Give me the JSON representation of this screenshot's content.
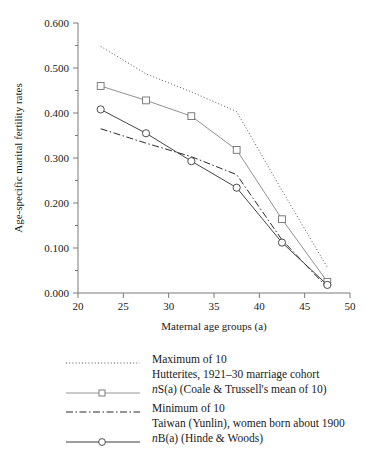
{
  "chart_data": {
    "type": "line",
    "title": "",
    "xlabel": "Maternal age groups (a)",
    "ylabel": "Age-specific marital fertility rates",
    "xlim": [
      20,
      50
    ],
    "ylim": [
      0.0,
      0.6
    ],
    "xticks": [
      20,
      25,
      30,
      35,
      40,
      45,
      50
    ],
    "xtick_labels": [
      "20",
      "25",
      "30",
      "35",
      "40",
      "45",
      "50"
    ],
    "yticks": [
      0.0,
      0.1,
      0.2,
      0.3,
      0.4,
      0.5,
      0.6
    ],
    "ytick_labels": [
      "0.000",
      "0.100",
      "0.200",
      "0.300",
      "0.400",
      "0.500",
      "0.600"
    ],
    "yminor_ticks": [
      0.05,
      0.15,
      0.25,
      0.35,
      0.45,
      0.55
    ],
    "grid": false,
    "legend_position": "below",
    "x": [
      22.5,
      27.5,
      32.5,
      37.5,
      42.5,
      47.5
    ],
    "series": [
      {
        "name": "maximum-of-10",
        "label_line1": "Maximum of 10",
        "label_line2": "Hutterites, 1921–30 marriage cohort",
        "style": "dotted",
        "marker": "none",
        "color": "#555555",
        "values": [
          0.548,
          0.487,
          0.447,
          0.403,
          0.228,
          0.057
        ]
      },
      {
        "name": "nS-a-coale-trussell",
        "label_line1": "nS(a) (Coale & Trussell's mean of 10)",
        "label_line2": "",
        "style": "solid",
        "marker": "square",
        "color": "#8a8a8a",
        "values": [
          0.46,
          0.428,
          0.393,
          0.318,
          0.164,
          0.025
        ]
      },
      {
        "name": "minimum-of-10",
        "label_line1": "Minimum of 10",
        "label_line2": "Taiwan (Yunlin), women born about 1900",
        "style": "dashdot",
        "marker": "none",
        "color": "#2a2a2a",
        "values": [
          0.365,
          0.333,
          0.303,
          0.263,
          0.118,
          0.012
        ]
      },
      {
        "name": "nB-a-hinde-woods",
        "label_line1": "nB(a) (Hinde & Woods)",
        "label_line2": "",
        "style": "solid",
        "marker": "circle",
        "color": "#3a3a3a",
        "values": [
          0.408,
          0.355,
          0.293,
          0.234,
          0.112,
          0.018
        ]
      }
    ]
  },
  "axes": {
    "ylabel": "Age-specific marital fertility rates",
    "xlabel": "Maternal age groups (a)",
    "xtick_20": "20",
    "xtick_25": "25",
    "xtick_30": "30",
    "xtick_35": "35",
    "xtick_40": "40",
    "xtick_45": "45",
    "xtick_50": "50",
    "ytick_000": "0.000",
    "ytick_100": "0.100",
    "ytick_200": "0.200",
    "ytick_300": "0.300",
    "ytick_400": "0.400",
    "ytick_500": "0.500",
    "ytick_600": "0.600"
  },
  "legend": {
    "entries": [
      {
        "line1": "Maximum of 10",
        "line2": "Hutterites, 1921–30 marriage cohort"
      },
      {
        "line1_pre": "n",
        "line1_post": "S(a) (Coale & Trussell's mean of 10)",
        "line2": ""
      },
      {
        "line1": "Minimum of 10",
        "line2": "Taiwan (Yunlin), women born about 1900"
      },
      {
        "line1_pre": "n",
        "line1_post": "B(a) (Hinde & Woods)",
        "line2": ""
      }
    ]
  }
}
